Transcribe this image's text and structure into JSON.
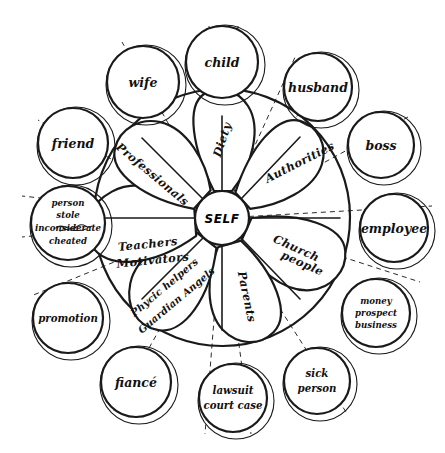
{
  "diagram": {
    "center": {
      "label": "SELF"
    },
    "colors": {
      "ink": "#1a1a1a",
      "paper": "#ffffff"
    },
    "petals": [
      {
        "id": "diety",
        "label": "Diety",
        "angle": -90,
        "rotate": -72
      },
      {
        "id": "authorities",
        "label": "Authorities",
        "angle": -45,
        "rotate": -27
      },
      {
        "id": "church",
        "label": "Church\npeople",
        "angle": 20,
        "rotate": 24
      },
      {
        "id": "parents",
        "label": "Parents",
        "angle": 70,
        "rotate": 76
      },
      {
        "id": "psychic",
        "label": "Phycic helpers\nGuardian Angels",
        "angle": 130,
        "rotate": -42
      },
      {
        "id": "teachers",
        "label": "Teachers\nMotivators",
        "angle": 178,
        "rotate": -6
      },
      {
        "id": "professionals",
        "label": "Professionals",
        "angle": -135,
        "rotate": 38
      }
    ],
    "outer_nodes": [
      {
        "id": "child",
        "lines": [
          "child"
        ],
        "cx": 222,
        "cy": 62,
        "r": 38
      },
      {
        "id": "husband",
        "lines": [
          "husband"
        ],
        "cx": 318,
        "cy": 87,
        "r": 36
      },
      {
        "id": "boss",
        "lines": [
          "boss"
        ],
        "cx": 381,
        "cy": 145,
        "r": 35
      },
      {
        "id": "employee",
        "lines": [
          "employee"
        ],
        "cx": 394,
        "cy": 228,
        "r": 36
      },
      {
        "id": "money",
        "lines": [
          "money",
          "prospect",
          "business"
        ],
        "cx": 376,
        "cy": 313,
        "r": 36
      },
      {
        "id": "sick-person",
        "lines": [
          "sick",
          "person"
        ],
        "cx": 317,
        "cy": 381,
        "r": 35
      },
      {
        "id": "lawsuit",
        "lines": [
          "lawsuit",
          "court case"
        ],
        "cx": 233,
        "cy": 398,
        "r": 36
      },
      {
        "id": "fiance",
        "lines": [
          "fiancé"
        ],
        "cx": 136,
        "cy": 382,
        "r": 37
      },
      {
        "id": "promotion",
        "lines": [
          "promotion"
        ],
        "cx": 68,
        "cy": 318,
        "r": 37
      },
      {
        "id": "person-hurt",
        "lines": [
          "person",
          "stole",
          "inconsiderate",
          "cheated"
        ],
        "cx": 68,
        "cy": 223,
        "r": 39
      },
      {
        "id": "friend",
        "lines": [
          "friend"
        ],
        "cx": 73,
        "cy": 143,
        "r": 37
      },
      {
        "id": "wife",
        "lines": [
          "wife"
        ],
        "cx": 143,
        "cy": 82,
        "r": 38
      }
    ],
    "ring": {
      "cx": 222,
      "cy": 218,
      "r": 128
    },
    "hub": {
      "cx": 222,
      "cy": 218,
      "r": 27
    },
    "spokes_dashed": 12
  }
}
